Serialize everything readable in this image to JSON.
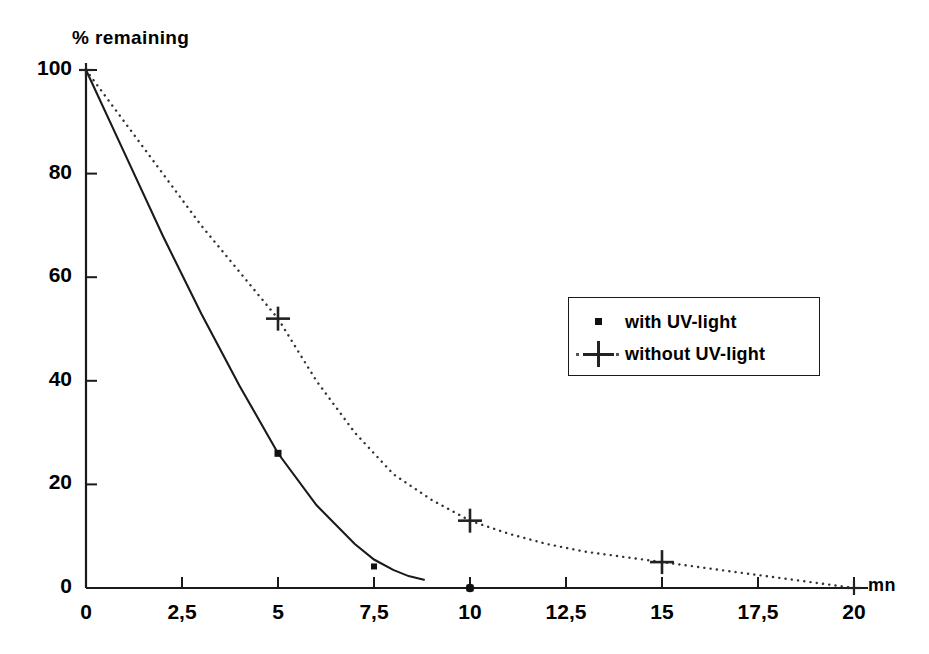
{
  "chart_data": {
    "type": "line",
    "title": "",
    "xlabel": "mn",
    "ylabel": "% remaining",
    "xlim": [
      0,
      20
    ],
    "ylim": [
      0,
      100
    ],
    "grid": false,
    "legend_position": "center-right",
    "x_ticks": [
      {
        "value": 0,
        "label": "0"
      },
      {
        "value": 2.5,
        "label": "2,5"
      },
      {
        "value": 5,
        "label": "5"
      },
      {
        "value": 7.5,
        "label": "7,5"
      },
      {
        "value": 10,
        "label": "10"
      },
      {
        "value": 12.5,
        "label": "12,5"
      },
      {
        "value": 15,
        "label": "15"
      },
      {
        "value": 17.5,
        "label": "17,5"
      },
      {
        "value": 20,
        "label": "20"
      }
    ],
    "y_ticks": [
      {
        "value": 0,
        "label": "0"
      },
      {
        "value": 20,
        "label": "20"
      },
      {
        "value": 40,
        "label": "40"
      },
      {
        "value": 60,
        "label": "60"
      },
      {
        "value": 80,
        "label": "80"
      },
      {
        "value": 100,
        "label": "100"
      }
    ],
    "series": [
      {
        "name": "with UV-light",
        "marker": "square",
        "line_style": "solid",
        "color": "#1a1a1a",
        "x": [
          0,
          5,
          7.5,
          10
        ],
        "values": [
          100,
          26,
          3,
          0
        ],
        "curve": [
          {
            "x": 0,
            "y": 100
          },
          {
            "x": 1,
            "y": 84
          },
          {
            "x": 2,
            "y": 68
          },
          {
            "x": 3,
            "y": 53
          },
          {
            "x": 4,
            "y": 39
          },
          {
            "x": 5,
            "y": 26
          },
          {
            "x": 6,
            "y": 16
          },
          {
            "x": 7,
            "y": 8.5
          },
          {
            "x": 7.5,
            "y": 5.5
          },
          {
            "x": 8,
            "y": 3.5
          },
          {
            "x": 8.4,
            "y": 2.3
          },
          {
            "x": 8.8,
            "y": 1.6
          }
        ]
      },
      {
        "name": "without UV-light",
        "marker": "plus",
        "line_style": "dotted",
        "color": "#333333",
        "x": [
          0,
          5,
          10,
          15,
          20
        ],
        "values": [
          100,
          52,
          13,
          5,
          0
        ],
        "curve": [
          {
            "x": 0,
            "y": 100
          },
          {
            "x": 1,
            "y": 90
          },
          {
            "x": 2,
            "y": 80
          },
          {
            "x": 3,
            "y": 70
          },
          {
            "x": 4,
            "y": 61
          },
          {
            "x": 5,
            "y": 52
          },
          {
            "x": 6,
            "y": 40
          },
          {
            "x": 7,
            "y": 30
          },
          {
            "x": 8,
            "y": 22
          },
          {
            "x": 9,
            "y": 17
          },
          {
            "x": 10,
            "y": 13
          },
          {
            "x": 11,
            "y": 10.5
          },
          {
            "x": 12,
            "y": 8.5
          },
          {
            "x": 13,
            "y": 7
          },
          {
            "x": 14,
            "y": 6
          },
          {
            "x": 15,
            "y": 5
          },
          {
            "x": 16,
            "y": 4
          },
          {
            "x": 17,
            "y": 3
          },
          {
            "x": 18,
            "y": 2
          },
          {
            "x": 19,
            "y": 1
          },
          {
            "x": 20,
            "y": 0
          }
        ]
      }
    ],
    "extra_markers": [
      {
        "series": "with UV-light",
        "x": 10,
        "y": 0,
        "marker": "dot"
      },
      {
        "series": "without UV-light",
        "x": 0,
        "y": 100,
        "marker": "plus-small"
      },
      {
        "series": "without UV-light",
        "x": 20,
        "y": 0,
        "marker": "plus-small"
      }
    ]
  },
  "legend": {
    "entries": [
      {
        "label": "with UV-light",
        "marker": "square-marker-icon"
      },
      {
        "label": "without UV-light",
        "marker": "plus-marker-icon"
      }
    ]
  }
}
